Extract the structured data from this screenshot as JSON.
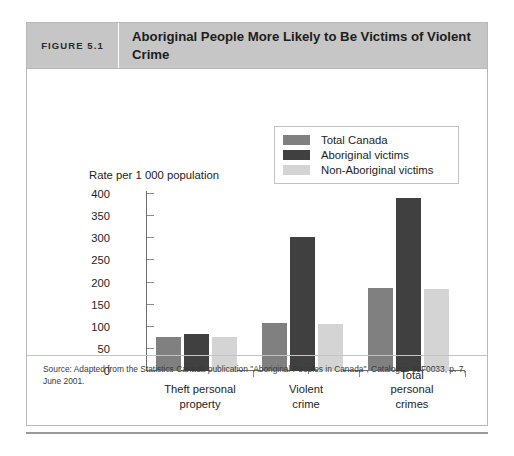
{
  "figure": {
    "number_label": "FIGURE 5.1",
    "title": "Aboriginal People More Likely to Be Victims of Violent Crime",
    "source_note": "Source: Adapted from the Statistics Canada publication \"Aboriginal Peoples in Canada\", Catalogue 85F0033, p. 7, June 2001."
  },
  "colors": {
    "total_canada": "#808080",
    "aboriginal_victims": "#404040",
    "non_aboriginal_victims": "#d4d4d4",
    "header_band": "#c6c6c6",
    "frame_border": "#b9b9b9",
    "axis": "#6f6f6f",
    "text": "#1d1d1d"
  },
  "chart_data": {
    "type": "bar",
    "title": "Aboriginal People More Likely to Be Victims of Violent Crime",
    "xlabel": "",
    "ylabel": "Rate per 1 000 population",
    "ylim": [
      0,
      400
    ],
    "yticks": [
      0,
      50,
      100,
      150,
      200,
      250,
      300,
      350,
      400
    ],
    "ytick_labels": [
      "0",
      "50",
      "100",
      "150",
      "200",
      "250",
      "300",
      "350",
      "400"
    ],
    "grid": false,
    "legend_position": "top-right",
    "categories": [
      "Theft personal property",
      "Violent crime",
      "Total personal crimes"
    ],
    "category_labels_multiline": [
      "Theft personal\nproperty",
      "Violent\ncrime",
      "Total personal\ncrimes"
    ],
    "series": [
      {
        "name": "Total Canada",
        "color": "#808080",
        "values": [
          77,
          108,
          187
        ]
      },
      {
        "name": "Aboriginal victims",
        "color": "#404040",
        "values": [
          83,
          303,
          390
        ]
      },
      {
        "name": "Non-Aboriginal victims",
        "color": "#d4d4d4",
        "values": [
          78,
          107,
          186
        ]
      }
    ]
  }
}
